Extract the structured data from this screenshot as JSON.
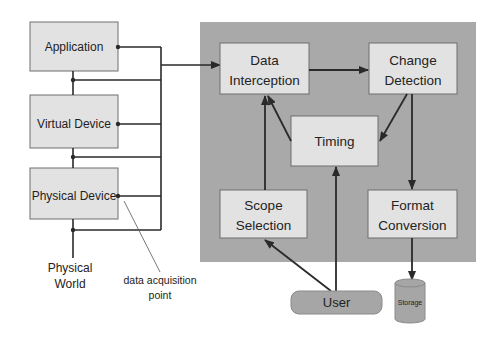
{
  "colors": {
    "panel": "#a9a9a9",
    "box_fill": "#e2e2e2",
    "box_stroke": "#6f6f6f",
    "line": "#2a2a2a",
    "user_fill": "#a6a6a6",
    "storage_fill": "#a6a6a6"
  },
  "left_stack": {
    "application": "Application",
    "virtual_device": "Virtual Device",
    "physical_device": "Physical Device"
  },
  "physical_world": [
    "Physical",
    "World"
  ],
  "annotation": [
    "data acquisition",
    "point"
  ],
  "panel": {
    "data_interception": [
      "Data",
      "Interception"
    ],
    "change_detection": [
      "Change",
      "Detection"
    ],
    "timing": "Timing",
    "scope_selection": [
      "Scope",
      "Selection"
    ],
    "format_conversion": [
      "Format",
      "Conversion"
    ]
  },
  "user": "User",
  "storage": "Storage"
}
